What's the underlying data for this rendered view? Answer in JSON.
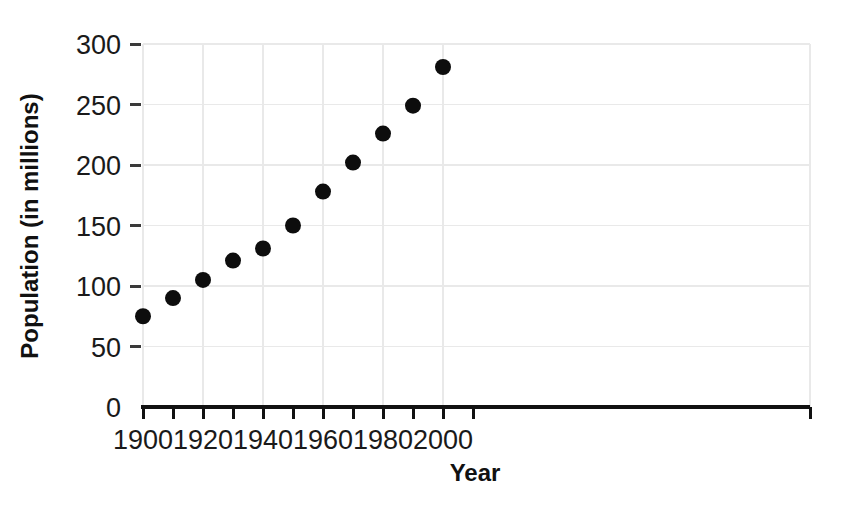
{
  "chart_data": {
    "type": "scatter",
    "title": "",
    "xlabel": "Year",
    "ylabel": "Population (in millions)",
    "x": [
      1900,
      1910,
      1920,
      1930,
      1940,
      1950,
      1960,
      1970,
      1980,
      1990,
      2000
    ],
    "values": [
      75,
      90,
      105,
      121,
      131,
      150,
      178,
      202,
      226,
      249,
      281
    ],
    "series": [
      {
        "name": "Population",
        "values": [
          75,
          90,
          105,
          121,
          131,
          150,
          178,
          202,
          226,
          249,
          281
        ]
      }
    ],
    "xlim": [
      1900,
      2010
    ],
    "ylim": [
      0,
      300
    ],
    "xticks": [
      1900,
      1910,
      1920,
      1930,
      1940,
      1950,
      1960,
      1970,
      1980,
      1990,
      2000,
      2010
    ],
    "xtick_labels": [
      "1900",
      "",
      "1920",
      "",
      "1940",
      "",
      "1960",
      "",
      "1980",
      "",
      "2000",
      ""
    ],
    "xtick_labels_major": [
      "1900",
      "1920",
      "1940",
      "1960",
      "1980",
      "2000"
    ],
    "xticks_major": [
      1900,
      1920,
      1940,
      1960,
      1980,
      2000
    ],
    "yticks": [
      0,
      50,
      100,
      150,
      200,
      250,
      300
    ],
    "ytick_labels": [
      "0",
      "50",
      "100",
      "150",
      "200",
      "250",
      "300"
    ],
    "grid": true,
    "grid_color": "#e9e9e9",
    "marker_color": "#0d0d0d",
    "marker_shape": "circle",
    "marker_radius": 8,
    "legend": null,
    "legend_position": "none",
    "axis_color": "#111111",
    "background": "#ffffff"
  },
  "axis_titles": {
    "x": "Year",
    "y": "Population (in millions)"
  }
}
